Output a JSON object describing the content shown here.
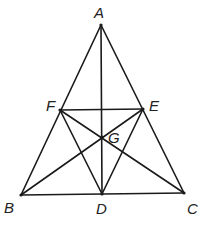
{
  "diagram": {
    "points": {
      "A": {
        "label": "A",
        "x": 101,
        "y": 25
      },
      "B": {
        "label": "B",
        "x": 21,
        "y": 195
      },
      "C": {
        "label": "C",
        "x": 184,
        "y": 193
      },
      "D": {
        "label": "D",
        "x": 102,
        "y": 194
      },
      "E": {
        "label": "E",
        "x": 143,
        "y": 109
      },
      "F": {
        "label": "F",
        "x": 60,
        "y": 110
      },
      "G": {
        "label": "G",
        "x": 102,
        "y": 137
      }
    },
    "segments": [
      [
        "A",
        "B"
      ],
      [
        "A",
        "C"
      ],
      [
        "B",
        "C"
      ],
      [
        "A",
        "D"
      ],
      [
        "B",
        "E"
      ],
      [
        "C",
        "F"
      ],
      [
        "F",
        "E"
      ],
      [
        "F",
        "D"
      ],
      [
        "E",
        "D"
      ]
    ],
    "labels": {
      "A": "A",
      "B": "B",
      "C": "C",
      "D": "D",
      "E": "E",
      "F": "F",
      "G": "G"
    }
  }
}
